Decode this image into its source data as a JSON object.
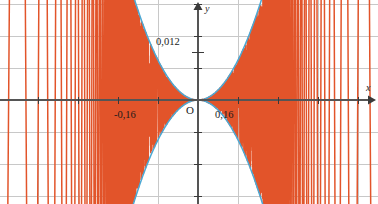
{
  "figure": {
    "width": 378,
    "height": 204,
    "background": "#ffffff"
  },
  "axes": {
    "x_axis_label": "x",
    "y_axis_label": "y",
    "origin_label": "O",
    "axis_color": "#555555",
    "grid_color": "#c8c8c8",
    "origin_px": {
      "x": 198,
      "y": 100
    }
  },
  "tick_labels": {
    "y_positive": "0,012",
    "x_negative": "-0,16",
    "x_positive": "0,16"
  },
  "colors": {
    "curve": "#e2542a",
    "envelope": "#4ba8d4",
    "grid": "#c8c8c8",
    "axis": "#555555",
    "text": "#1a1a1a"
  },
  "chart_data": {
    "type": "line",
    "title": "",
    "xlabel": "x",
    "ylabel": "y",
    "grid": true,
    "legend": false,
    "xlim": [
      -0.495,
      0.45
    ],
    "ylim": [
      -0.0256,
      0.0256
    ],
    "x_ticks": [
      -0.16,
      0.16
    ],
    "x_tick_labels": [
      "-0,16",
      "0,16"
    ],
    "y_ticks": [
      0.012
    ],
    "y_tick_labels": [
      "0,012"
    ],
    "grid_x_values": [
      -0.4,
      -0.3,
      -0.2,
      -0.1,
      0.0,
      0.1,
      0.2,
      0.3,
      0.4
    ],
    "grid_y_values": [
      -0.024,
      -0.016,
      -0.008,
      0.0,
      0.008,
      0.016,
      0.024
    ],
    "series": [
      {
        "name": "oscillating-curve",
        "color": "#e2542a",
        "formula": "x^2*sin(1/x^3)",
        "description": "rapidly oscillating curve damped toward origin, vertical excursions beyond plot bounds away from origin"
      },
      {
        "name": "envelope-upper",
        "color": "#4ba8d4",
        "formula": "x^2",
        "description": "upper parabolic envelope"
      },
      {
        "name": "envelope-lower",
        "color": "#4ba8d4",
        "formula": "-x^2",
        "description": "lower parabolic envelope"
      }
    ]
  }
}
